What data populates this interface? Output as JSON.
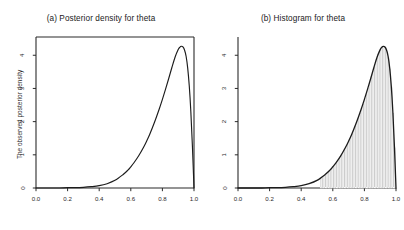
{
  "figure": {
    "width": 404,
    "height": 230,
    "background": "#ffffff",
    "axis_color": "#2b2b2b",
    "curve_color": "#1c1c1c",
    "hist_fill": "#c9c9c9",
    "hist_edge": "#ffffff"
  },
  "panels": {
    "a": {
      "title": "(a) Posterior density for theta",
      "ylabel": "The observed posterior density",
      "xlabel": "",
      "frame": "box"
    },
    "b": {
      "title": "(b) Histogram for theta",
      "ylabel": "",
      "xlabel": "",
      "frame": "L"
    }
  },
  "axes": {
    "xticks": [
      "0.0",
      "0.2",
      "0.4",
      "0.6",
      "0.8",
      "1.0"
    ],
    "yticks": [
      "0",
      "1",
      "2",
      "3",
      "4"
    ],
    "xlim": [
      0,
      1
    ],
    "ylim": [
      0,
      4.55
    ]
  },
  "chart_data": [
    {
      "type": "line",
      "title": "(a) Posterior density for theta",
      "xlabel": "",
      "ylabel": "The observed posterior density",
      "xlim": [
        0,
        1
      ],
      "ylim": [
        0,
        4.55
      ],
      "xticks": [
        0.0,
        0.2,
        0.4,
        0.6,
        0.8,
        1.0
      ],
      "yticks": [
        0,
        1,
        2,
        3,
        4
      ],
      "grid": false,
      "legend": "none",
      "series": [
        {
          "name": "posterior density",
          "x": [
            0.0,
            0.05,
            0.1,
            0.15,
            0.2,
            0.25,
            0.3,
            0.35,
            0.4,
            0.45,
            0.5,
            0.55,
            0.58,
            0.6,
            0.62,
            0.65,
            0.68,
            0.7,
            0.72,
            0.75,
            0.78,
            0.8,
            0.82,
            0.84,
            0.86,
            0.88,
            0.9,
            0.91,
            0.92,
            0.93,
            0.94,
            0.95,
            0.96,
            0.97,
            0.98,
            0.99,
            1.0
          ],
          "y": [
            0.0,
            0.0,
            0.0,
            0.0,
            0.01,
            0.01,
            0.02,
            0.04,
            0.07,
            0.13,
            0.23,
            0.4,
            0.53,
            0.64,
            0.76,
            0.97,
            1.22,
            1.41,
            1.62,
            1.98,
            2.38,
            2.67,
            2.98,
            3.3,
            3.63,
            3.94,
            4.17,
            4.24,
            4.27,
            4.25,
            4.16,
            3.97,
            3.62,
            3.08,
            2.3,
            1.25,
            0.0
          ]
        }
      ]
    },
    {
      "type": "histogram",
      "title": "(b) Histogram for theta",
      "xlabel": "",
      "ylabel": "",
      "xlim": [
        0,
        1
      ],
      "ylim": [
        0,
        4.55
      ],
      "xticks": [
        0.0,
        0.2,
        0.4,
        0.6,
        0.8,
        1.0
      ],
      "yticks": [
        0,
        1,
        2,
        3,
        4
      ],
      "grid": false,
      "legend": "none",
      "bin_width": 0.01,
      "bin_left_edges": [
        0.52,
        0.53,
        0.54,
        0.55,
        0.56,
        0.57,
        0.58,
        0.59,
        0.6,
        0.61,
        0.62,
        0.63,
        0.64,
        0.65,
        0.66,
        0.67,
        0.68,
        0.69,
        0.7,
        0.71,
        0.72,
        0.73,
        0.74,
        0.75,
        0.76,
        0.77,
        0.78,
        0.79,
        0.8,
        0.81,
        0.82,
        0.83,
        0.84,
        0.85,
        0.86,
        0.87,
        0.88,
        0.89,
        0.9,
        0.91,
        0.92,
        0.93,
        0.94,
        0.95,
        0.96,
        0.97,
        0.98,
        0.99
      ],
      "counts": [
        0.29,
        0.33,
        0.37,
        0.41,
        0.45,
        0.5,
        0.56,
        0.61,
        0.66,
        0.72,
        0.79,
        0.86,
        0.94,
        1.0,
        1.1,
        1.2,
        1.26,
        1.35,
        1.45,
        1.55,
        1.66,
        1.78,
        1.88,
        2.01,
        2.14,
        2.27,
        2.41,
        2.55,
        2.7,
        2.85,
        3.01,
        3.18,
        3.35,
        3.52,
        3.7,
        3.88,
        4.06,
        4.16,
        4.22,
        4.26,
        4.24,
        4.22,
        4.13,
        3.93,
        3.6,
        3.05,
        2.28,
        1.22
      ],
      "overlay_curve": {
        "name": "posterior density",
        "x": [
          0.0,
          0.05,
          0.1,
          0.15,
          0.2,
          0.25,
          0.3,
          0.35,
          0.4,
          0.45,
          0.5,
          0.55,
          0.58,
          0.6,
          0.62,
          0.65,
          0.68,
          0.7,
          0.72,
          0.75,
          0.78,
          0.8,
          0.82,
          0.84,
          0.86,
          0.88,
          0.9,
          0.91,
          0.92,
          0.93,
          0.94,
          0.95,
          0.96,
          0.97,
          0.98,
          0.99,
          1.0
        ],
        "y": [
          0.0,
          0.0,
          0.0,
          0.0,
          0.01,
          0.01,
          0.02,
          0.04,
          0.07,
          0.13,
          0.23,
          0.4,
          0.53,
          0.64,
          0.76,
          0.97,
          1.22,
          1.41,
          1.62,
          1.98,
          2.38,
          2.67,
          2.98,
          3.3,
          3.63,
          3.94,
          4.17,
          4.24,
          4.27,
          4.25,
          4.16,
          3.97,
          3.62,
          3.08,
          2.3,
          1.25,
          0.0
        ]
      }
    }
  ]
}
